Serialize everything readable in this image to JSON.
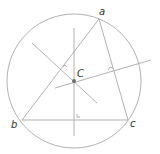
{
  "diagram": {
    "type": "circumcircle",
    "colors": {
      "line": "#a8a8a8",
      "center_dot": "#707070",
      "label": "#333333"
    },
    "circle": {
      "cx": 74,
      "cy": 81,
      "r": 67
    },
    "triangle": {
      "vertices": [
        {
          "id": "a",
          "label": "a",
          "x": 99,
          "y": 19
        },
        {
          "id": "b",
          "label": "b",
          "x": 22,
          "y": 120
        },
        {
          "id": "c",
          "label": "c",
          "x": 128,
          "y": 120
        }
      ]
    },
    "center": {
      "label": "C",
      "x": 74,
      "y": 81
    },
    "bisectors": [
      {
        "name": "bisector-bc",
        "x1": 74,
        "y1": 28,
        "x2": 74,
        "y2": 136
      },
      {
        "name": "bisector-ab",
        "x1": 32,
        "y1": 43,
        "x2": 97,
        "y2": 103
      },
      {
        "name": "bisector-ac",
        "x1": 55,
        "y1": 88,
        "x2": 151,
        "y2": 60
      }
    ]
  }
}
